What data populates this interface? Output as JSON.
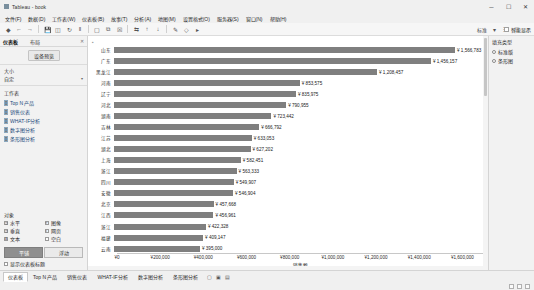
{
  "window": {
    "title": "Tableau - book",
    "minimize": "─",
    "maximize": "☐",
    "close": "✕"
  },
  "menubar": [
    "文件(F)",
    "数据(D)",
    "工作表(W)",
    "仪表板(B)",
    "故事(T)",
    "分析(A)",
    "地图(M)",
    "设置格式(O)",
    "服务器(S)",
    "窗口(N)",
    "帮助(H)"
  ],
  "toolbar": {
    "items": [
      "tableau-logo-icon",
      "back-icon",
      "forward-icon",
      "save-icon",
      "new-data-source-icon",
      "refresh-icon",
      "pause-icon",
      "new-worksheet-icon",
      "duplicate-icon",
      "clear-icon",
      "swap-icon",
      "sort-asc-icon",
      "sort-desc-icon",
      "highlight-icon",
      "group-icon",
      "labels-icon",
      "fit-dropdown-icon",
      "fixed-axis-icon",
      "presentation-icon",
      "share-icon"
    ],
    "fit_label": "标准",
    "smart_show_label": "智能显示"
  },
  "left_pane": {
    "tabs": [
      {
        "label": "仪表板",
        "active": true
      },
      {
        "label": "布局",
        "active": false
      }
    ],
    "close_icon": "✕",
    "device_preview_button": "设备预览",
    "size": {
      "title": "大小",
      "value": "自定"
    },
    "worksheets": {
      "title": "工作表",
      "items": [
        {
          "label": "Top N 产品",
          "icon": "bar-chart-icon"
        },
        {
          "label": "销售仪表",
          "icon": "gauge-icon"
        },
        {
          "label": "WHAT-IF分析",
          "icon": "bar-chart-icon"
        },
        {
          "label": "数字图分析",
          "icon": "number-icon"
        },
        {
          "label": "条形图分析",
          "icon": "bar-chart-icon"
        }
      ]
    },
    "objects": {
      "title": "对象",
      "items": [
        {
          "label": "水平",
          "icon": "horizontal-container-icon"
        },
        {
          "label": "图像",
          "icon": "image-icon"
        },
        {
          "label": "垂直",
          "icon": "vertical-container-icon"
        },
        {
          "label": "网页",
          "icon": "web-page-icon"
        },
        {
          "label": "文本",
          "icon": "text-icon"
        },
        {
          "label": "空白",
          "icon": "blank-icon"
        }
      ]
    },
    "placement": [
      {
        "label": "平铺",
        "active": true
      },
      {
        "label": "浮动",
        "active": false
      }
    ],
    "show_title_checkbox": "显示仪表板标题"
  },
  "right_pane": {
    "title": "填充类型",
    "options": [
      {
        "label": "标准版",
        "selected": false
      },
      {
        "label": "条形图",
        "selected": true
      }
    ]
  },
  "bottom": {
    "tabs": [
      {
        "label": "仪表板",
        "active": true
      },
      {
        "label": "Top N 产品",
        "active": false
      },
      {
        "label": "销售仪表",
        "active": false
      },
      {
        "label": "WHAT-IF分析",
        "active": false
      },
      {
        "label": "数字图分析",
        "active": false
      },
      {
        "label": "条形图分析",
        "active": false
      },
      {
        "label": "新建仪表板",
        "active": false
      }
    ],
    "icons": [
      "new-worksheet-icon",
      "new-dashboard-icon",
      "new-story-icon"
    ],
    "status_icons": [
      "data-source-icon",
      "grid-icon",
      "fit-icon"
    ]
  },
  "chart_data": {
    "type": "bar",
    "title": "",
    "xlabel": "销售额",
    "ylabel": "",
    "orientation": "horizontal",
    "currency_symbol": "¥",
    "xlim": [
      0,
      1700000
    ],
    "xticks": [
      0,
      200000,
      400000,
      600000,
      800000,
      1000000,
      1200000,
      1400000,
      1600000
    ],
    "xticklabels": [
      "¥0",
      "¥200,000",
      "¥400,000",
      "¥600,000",
      "¥800,000",
      "¥1,000,000",
      "¥1,200,000",
      "¥1,400,000",
      "¥1,600,000"
    ],
    "bar_color": "#7f7f7f",
    "grid": false,
    "legend": "none",
    "categories": [
      "山东",
      "广东",
      "黑龙江",
      "河南",
      "辽宁",
      "河北",
      "湖南",
      "吉林",
      "江苏",
      "湖北",
      "上海",
      "浙江",
      "四川",
      "安徽",
      "北京",
      "江西",
      "浙江",
      "福建",
      "云南"
    ],
    "values": [
      1566783,
      1456157,
      1208457,
      853575,
      835975,
      790955,
      723442,
      666792,
      633053,
      627202,
      582451,
      563333,
      549907,
      546904,
      457668,
      456961,
      422328,
      409147,
      395000
    ],
    "value_labels": [
      "¥ 1,566,783",
      "¥ 1,456,157",
      "¥ 1,208,457",
      "¥ 853,575",
      "¥ 835,975",
      "¥ 790,955",
      "¥ 723,442",
      "¥ 666,792",
      "¥ 633,053",
      "¥ 627,202",
      "¥ 582,451",
      "¥ 563,333",
      "¥ 549,907",
      "¥ 546,904",
      "¥ 457,668",
      "¥ 456,961",
      "¥ 422,328",
      "¥ 409,147",
      "¥ 395,000"
    ]
  }
}
